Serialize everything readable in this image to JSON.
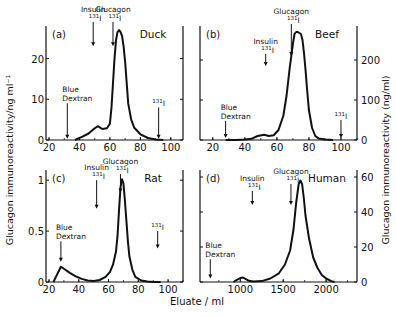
{
  "figure": {
    "left_ylabel": "Glucagon  immunoreactivity/ng  ml⁻¹",
    "right_ylabel": "Glucagon  immunoreactivity (ng/ml)",
    "xlabel": "Eluate / ml"
  },
  "chart_data": [
    {
      "type": "line",
      "panel": "(a)",
      "title": "Duck",
      "xlabel": "Eluate / ml",
      "ylabel": "Glucagon immunoreactivity/ng ml-1",
      "y_axis_side": "left",
      "xlim": [
        18,
        108
      ],
      "ylim": [
        0,
        28
      ],
      "xticks": [
        20,
        40,
        60,
        80,
        100
      ],
      "yticks": [
        0,
        10,
        20
      ],
      "box": {
        "x0": 46,
        "x1": 183,
        "y0": 140,
        "y1": 26
      },
      "series": [
        {
          "name": "Duck",
          "x": [
            37,
            42,
            46,
            49,
            52,
            55,
            58,
            60,
            61,
            62,
            63,
            64,
            65,
            66,
            67,
            68,
            69,
            70,
            71,
            72,
            74,
            76,
            80,
            85,
            90,
            95
          ],
          "y": [
            0,
            0.8,
            1.6,
            2.6,
            3.4,
            2.7,
            2.9,
            4,
            8,
            14,
            20,
            24.5,
            26.5,
            27,
            26.5,
            25.5,
            23,
            19,
            14,
            9,
            5,
            3,
            1.4,
            0.5,
            0.15,
            0
          ]
        }
      ],
      "markers": [
        {
          "label": "Blue\nDextran",
          "x": 32,
          "y_top": 9,
          "y_bot": 0.3
        },
        {
          "label": "Insulin\n131I",
          "x": 49,
          "y_top": 29,
          "y_bot": 23
        },
        {
          "label": "Glucagon\n131I",
          "x": 62,
          "y_top": 29,
          "y_bot": 23
        },
        {
          "label": "131I",
          "x": 92,
          "y_top": 8,
          "y_bot": 0.3
        }
      ]
    },
    {
      "type": "line",
      "panel": "(b)",
      "title": "Beef",
      "xlabel": "Eluate / ml",
      "ylabel": "Glucagon immunoreactivity (ng/ml)",
      "y_axis_side": "right",
      "xlim": [
        12,
        110
      ],
      "ylim": [
        0,
        285
      ],
      "xticks": [
        20,
        40,
        60,
        80,
        100
      ],
      "yticks": [
        0,
        100,
        200
      ],
      "box": {
        "x0": 200,
        "x1": 357,
        "y0": 140,
        "y1": 26
      },
      "series": [
        {
          "name": "Beef",
          "x": [
            28,
            35,
            40,
            44,
            48,
            52,
            55,
            58,
            61,
            64,
            66,
            68,
            70,
            71,
            72,
            73,
            75,
            76,
            77,
            78,
            79,
            80,
            82,
            84,
            86,
            90,
            95
          ],
          "y": [
            0,
            0,
            1,
            3,
            10,
            13,
            10,
            12,
            25,
            60,
            110,
            180,
            240,
            265,
            270,
            270,
            265,
            250,
            215,
            170,
            120,
            75,
            30,
            10,
            4,
            1,
            0
          ]
        }
      ],
      "markers": [
        {
          "label": "Blue\nDextran",
          "x": 28,
          "y_top": 48,
          "y_bot": 5
        },
        {
          "label": "Insulin\n131I",
          "x": 53,
          "y_top": 215,
          "y_bot": 185
        },
        {
          "label": "Glucagon\n131I",
          "x": 69,
          "y_top": 290,
          "y_bot": 210
        },
        {
          "label": "131I",
          "x": 100,
          "y_top": 50,
          "y_bot": 5
        }
      ]
    },
    {
      "type": "line",
      "panel": "(c)",
      "title": "Rat",
      "xlabel": "Eluate / ml",
      "ylabel": "Glucagon immunoreactivity/ng ml-1",
      "y_axis_side": "left",
      "xlim": [
        18,
        110
      ],
      "ylim": [
        0,
        1.1
      ],
      "xticks": [
        20,
        40,
        60,
        80,
        100
      ],
      "yticks": [
        0,
        0.5,
        1.0
      ],
      "box": {
        "x0": 46,
        "x1": 183,
        "y0": 282,
        "y1": 170
      },
      "series": [
        {
          "name": "Rat",
          "x": [
            23,
            25,
            27,
            28,
            30,
            34,
            38,
            42,
            46,
            50,
            54,
            58,
            61,
            63,
            65,
            66,
            67,
            68,
            69,
            70,
            71,
            72,
            73,
            74,
            76,
            78,
            82,
            86,
            90,
            95
          ],
          "y": [
            0,
            0.06,
            0.12,
            0.15,
            0.13,
            0.09,
            0.055,
            0.03,
            0.015,
            0.01,
            0.02,
            0.05,
            0.1,
            0.17,
            0.3,
            0.45,
            0.7,
            0.93,
            1.01,
            0.97,
            0.8,
            0.6,
            0.4,
            0.25,
            0.12,
            0.05,
            0.015,
            0.005,
            0,
            0
          ]
        }
      ],
      "markers": [
        {
          "label": "Blue\nDextran",
          "x": 28,
          "y_top": 0.4,
          "y_bot": 0.2
        },
        {
          "label": "Insulin\n131I",
          "x": 52,
          "y_top": 1.0,
          "y_bot": 0.72
        },
        {
          "label": "Glucagon\n131I",
          "x": 68,
          "y_top": 1.06,
          "y_bot": 0.88
        },
        {
          "label": "131I",
          "x": 93,
          "y_top": 0.5,
          "y_bot": 0.33
        }
      ]
    },
    {
      "type": "line",
      "panel": "(d)",
      "title": "Human",
      "xlabel": "Eluate / ml",
      "ylabel": "Glucagon immunoreactivity (ng/ml)",
      "y_axis_side": "right",
      "xlim": [
        530,
        2360
      ],
      "ylim": [
        0,
        64
      ],
      "xticks": [
        1000,
        1500,
        2000
      ],
      "yticks": [
        0,
        20,
        40,
        60
      ],
      "box": {
        "x0": 200,
        "x1": 357,
        "y0": 282,
        "y1": 170
      },
      "series": [
        {
          "name": "Human",
          "x": [
            920,
            960,
            1000,
            1030,
            1060,
            1100,
            1150,
            1250,
            1350,
            1450,
            1520,
            1580,
            1620,
            1650,
            1680,
            1700,
            1720,
            1740,
            1760,
            1800,
            1850,
            1900,
            1950,
            2000,
            2060,
            2100
          ],
          "y": [
            0,
            1.2,
            2.2,
            2.5,
            1.8,
            0.7,
            0.2,
            0.5,
            2,
            5,
            10,
            18,
            30,
            45,
            56,
            58,
            56,
            48,
            38,
            25,
            14,
            8,
            4,
            2,
            0.5,
            0
          ]
        }
      ],
      "markers": [
        {
          "label": "Blue\nDextran",
          "x": 650,
          "y_top": 13,
          "y_bot": 2
        },
        {
          "label": "Insulin\n131I",
          "x": 1140,
          "y_top": 52,
          "y_bot": 44
        },
        {
          "label": "Glucagon\n131I",
          "x": 1590,
          "y_top": 56,
          "y_bot": 44
        }
      ]
    }
  ]
}
